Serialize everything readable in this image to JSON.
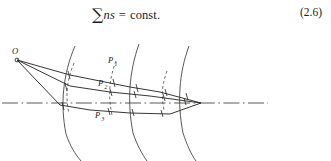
{
  "page": {
    "width": 331,
    "height": 161,
    "background_color": "#ffffff",
    "ink_color": "#20201f"
  },
  "equation": {
    "sum_symbol": "∑",
    "variables": "ns",
    "equals": "=",
    "right_side": "const.",
    "full_text": "∑ns = const.",
    "number": "(2.6)"
  },
  "figure": {
    "type": "optical-ray-wavefront-diagram",
    "labels": [
      {
        "id": "O",
        "base": "O",
        "sub": "",
        "x": 14,
        "y": 19
      },
      {
        "id": "P1",
        "base": "P",
        "sub": "1",
        "x": 109,
        "y": 29
      },
      {
        "id": "P2",
        "base": "P",
        "sub": "2",
        "x": 99,
        "y": 52
      },
      {
        "id": "P3",
        "base": "P",
        "sub": "3",
        "x": 96,
        "y": 83
      }
    ],
    "source_point": {
      "name": "point-source-O",
      "x": 17,
      "y": 26,
      "radius": 1.9
    },
    "convergence_point": {
      "name": "image-point",
      "x": 201,
      "y": 69
    },
    "optical_axis": {
      "name": "optical-axis",
      "style": "dash-dot",
      "y": 69,
      "x_start": 2,
      "x_end": 268
    },
    "rays": [
      {
        "name": "ray-upper",
        "points": "17,26 70,41 100,47 130,53 160,58 201,69"
      },
      {
        "name": "ray-middle",
        "points": "17,26 70,52 110,58 150,62 201,69"
      },
      {
        "name": "ray-lower",
        "points": "17,26 60,71 90,76 130,79 170,80 201,69"
      }
    ],
    "wavefronts": [
      {
        "name": "wavefront-1",
        "style": "dashed",
        "cx": 23,
        "cy": 74,
        "r": 52,
        "span": 78
      },
      {
        "name": "wavefront-2",
        "style": "solid",
        "cx": -25,
        "cy": 76,
        "r": 105,
        "span": 118
      },
      {
        "name": "wavefront-3",
        "style": "dashed",
        "cx": -5,
        "cy": 71,
        "r": 117,
        "span": 72
      },
      {
        "name": "wavefront-4",
        "style": "solid",
        "cx": 13,
        "cy": 72,
        "r": 128,
        "span": 118
      },
      {
        "name": "wavefront-5",
        "style": "dashed",
        "cx": 38,
        "cy": 71,
        "r": 131,
        "span": 62
      },
      {
        "name": "wavefront-6",
        "style": "solid",
        "cx": 56,
        "cy": 71,
        "r": 136,
        "span": 114
      }
    ],
    "tick_marks_count": 14,
    "caption_partial": ""
  }
}
